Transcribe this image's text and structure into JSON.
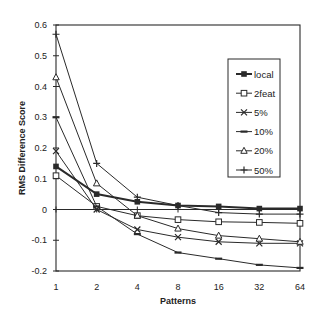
{
  "chart_data": {
    "type": "line",
    "title": "",
    "xlabel": "Patterns",
    "ylabel": "RMS Difference Score",
    "x": [
      1,
      2,
      4,
      8,
      16,
      32,
      64
    ],
    "x_tick_labels": [
      "1",
      "2",
      "4",
      "8",
      "16",
      "32",
      "64"
    ],
    "x_scale": "log2",
    "ylim": [
      -0.2,
      0.6
    ],
    "y_ticks": [
      -0.2,
      -0.1,
      0,
      0.1,
      0.2,
      0.3,
      0.4,
      0.5,
      0.6
    ],
    "y_tick_labels": [
      "-0.2",
      "-0.1",
      "0",
      "0.1",
      "0.2",
      "0.3",
      "0.4",
      "0.5",
      "0.6"
    ],
    "grid": false,
    "zero_line": true,
    "legend_position": "upper right (inside)",
    "series": [
      {
        "name": "local",
        "marker": "filled-square",
        "line_width": 2,
        "values": [
          0.14,
          0.05,
          0.025,
          0.013,
          0.01,
          0.003,
          0.003
        ]
      },
      {
        "name": "2feat",
        "marker": "open-square",
        "line_width": 1,
        "values": [
          0.11,
          0.01,
          -0.02,
          -0.033,
          -0.04,
          -0.042,
          -0.045
        ]
      },
      {
        "name": "5%",
        "marker": "x",
        "line_width": 1,
        "values": [
          0.19,
          0.0,
          -0.065,
          -0.09,
          -0.105,
          -0.11,
          -0.11
        ]
      },
      {
        "name": "10%",
        "marker": "dash",
        "line_width": 1,
        "values": [
          0.3,
          0.01,
          -0.08,
          -0.14,
          -0.16,
          -0.18,
          -0.19
        ]
      },
      {
        "name": "20%",
        "marker": "triangle",
        "line_width": 1,
        "values": [
          0.43,
          0.085,
          -0.02,
          -0.062,
          -0.085,
          -0.095,
          -0.105
        ]
      },
      {
        "name": "50%",
        "marker": "plus",
        "line_width": 1,
        "values": [
          0.57,
          0.15,
          0.04,
          0.013,
          -0.01,
          -0.015,
          -0.015
        ]
      }
    ]
  }
}
